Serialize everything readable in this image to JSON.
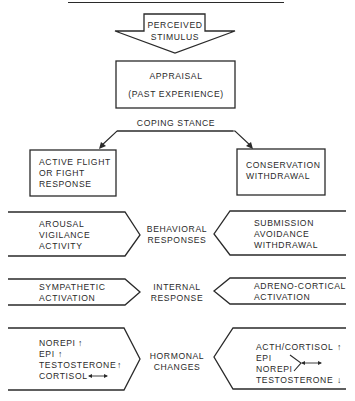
{
  "diagram": {
    "stimulus": {
      "line1": "PERCEIVED",
      "line2": "STIMULUS"
    },
    "appraisal": {
      "line1": "APPRAISAL",
      "line2": "(PAST EXPERIENCE)"
    },
    "coping_stance": "COPING STANCE",
    "left_branch": {
      "title_lines": [
        "ACTIVE FLIGHT",
        "OR FIGHT",
        "RESPONSE"
      ]
    },
    "right_branch": {
      "title_lines": [
        "CONSERVATION",
        "WITHDRAWAL"
      ]
    },
    "rows": [
      {
        "center_label": [
          "BEHAVIORAL",
          "RESPONSES"
        ],
        "left_items": [
          "AROUSAL",
          "VIGILANCE",
          "ACTIVITY"
        ],
        "right_items": [
          "SUBMISSION",
          "AVOIDANCE",
          "WITHDRAWAL"
        ]
      },
      {
        "center_label": [
          "INTERNAL",
          "RESPONSE"
        ],
        "left_items": [
          "SYMPATHETIC",
          "ACTIVATION"
        ],
        "right_items": [
          "ADRENO-CORTICAL",
          "ACTIVATION"
        ]
      },
      {
        "center_label": [
          "HORMONAL",
          "CHANGES"
        ],
        "left_items": [
          {
            "label": "NOREPI",
            "trend": "up"
          },
          {
            "label": "EPI",
            "trend": "up"
          },
          {
            "label": "TESTOSTERONE",
            "trend": "up"
          },
          {
            "label": "CORTISOL",
            "trend": "unchanged"
          }
        ],
        "right_items": [
          {
            "label": "ACTH/CORTISOL",
            "trend": "up"
          },
          {
            "label": "EPI",
            "trend": "unchanged",
            "grouped_with": "NOREPI"
          },
          {
            "label": "NOREPI",
            "trend": "unchanged",
            "grouped_with": "EPI"
          },
          {
            "label": "TESTOSTERONE",
            "trend": "down"
          }
        ]
      }
    ],
    "trend_symbols": {
      "up": "↑",
      "down": "↓",
      "unchanged": "↔"
    },
    "colors": {
      "ink": "#2a2a2a",
      "background": "#ffffff"
    }
  }
}
